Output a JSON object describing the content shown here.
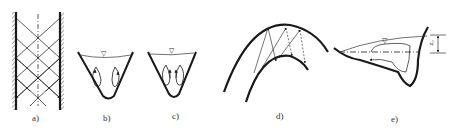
{
  "figure": {
    "panels": [
      {
        "id": "a",
        "label": "a)",
        "description": "straight channel with criss-crossing oblique wave reflections between two walls"
      },
      {
        "id": "b",
        "label": "b)",
        "description": "V-shaped channel cross-section with free surface and two counter-rotating secondary flow cells"
      },
      {
        "id": "c",
        "label": "c)",
        "description": "V-shaped channel cross-section with free surface and two secondary flow cells rotating the opposite direction"
      },
      {
        "id": "d",
        "label": "d)",
        "description": "curved channel bend with reflected wave rays between outer and inner banks"
      },
      {
        "id": "e",
        "label": "e)",
        "description": "bend cross-section with superelevated free surface, circulation cell and dimension"
      }
    ],
    "dimension_label": "z₀",
    "water_surface_symbol": "▽"
  },
  "colors": {
    "ink": "#1a1a1a",
    "hatch": "#555555",
    "background": "#ffffff"
  }
}
